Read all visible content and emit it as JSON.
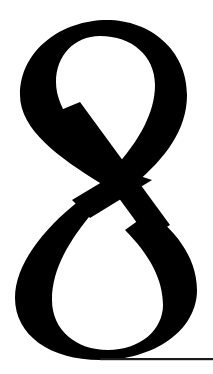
{
  "figure": {
    "glyph": "8",
    "glyph_color": "#000000",
    "background": "#ffffff",
    "rule_color": "#1a1a1a"
  }
}
